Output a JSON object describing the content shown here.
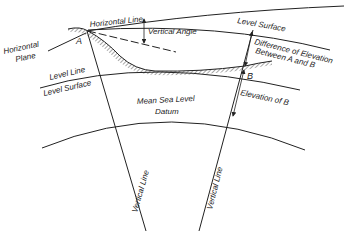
{
  "diagram": {
    "points": {
      "a": "A",
      "b": "B"
    },
    "labels": {
      "horizontal_line": "Horizontal Line",
      "horizontal_plane_1": "Horizontal",
      "horizontal_plane_2": "Plane",
      "vertical_angle": "Vertical Angle",
      "level_surface_top": "Level Surface",
      "diff_elev_1": "Difference of Elevation",
      "diff_elev_2": "Between A and B",
      "level_line": "Level Line",
      "level_surface_left": "Level Surface",
      "elevation_of_b": "Elevation of B",
      "mean_sea_level": "Mean Sea Level",
      "datum": "Datum",
      "vertical_line_a": "Vertical Line",
      "vertical_line_b": "Vertical Line"
    },
    "colors": {
      "ink": "#222222",
      "background": "#ffffff"
    }
  }
}
